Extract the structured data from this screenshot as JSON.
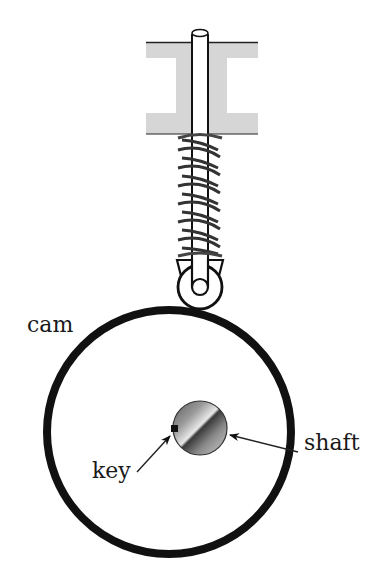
{
  "diagram": {
    "labels": {
      "cam": "cam",
      "key": "key",
      "shaft": "shaft"
    },
    "components": [
      {
        "name": "guide-bearing",
        "description": "I-shaped guide block"
      },
      {
        "name": "follower-rod",
        "description": "vertical rod through guide"
      },
      {
        "name": "spring",
        "description": "helical compression spring around rod"
      },
      {
        "name": "roller-follower",
        "description": "roller with pin in fork at bottom of rod"
      },
      {
        "name": "cam",
        "description": "large circular cam disc"
      },
      {
        "name": "shaft",
        "description": "shaded circular shaft at center"
      },
      {
        "name": "key",
        "description": "small square key on shaft"
      }
    ],
    "colors": {
      "ink": "#111111",
      "guide_fill": "#d6d6d6",
      "background": "#ffffff"
    }
  }
}
